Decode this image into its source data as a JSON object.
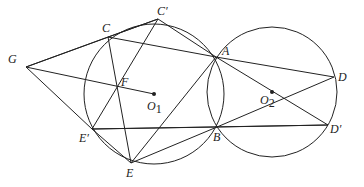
{
  "diagram": {
    "stroke_color": "#222222",
    "circles": [
      {
        "name": "O1",
        "cx": 154,
        "cy": 94,
        "r": 70
      },
      {
        "name": "O2",
        "cx": 272,
        "cy": 92,
        "r": 65
      }
    ],
    "points": {
      "G": {
        "x": 26,
        "y": 67,
        "label": "G",
        "lx": 8,
        "ly": 63
      },
      "C": {
        "x": 108,
        "y": 37,
        "label": "C",
        "lx": 102,
        "ly": 32
      },
      "Cp": {
        "x": 158,
        "y": 19,
        "label": "C′",
        "lx": 157,
        "ly": 15
      },
      "F": {
        "x": 117,
        "y": 87,
        "label": "F",
        "lx": 121,
        "ly": 86
      },
      "O1": {
        "x": 154,
        "y": 94,
        "label": "O",
        "sub": "1",
        "lx": 147,
        "ly": 110
      },
      "A": {
        "x": 216,
        "y": 57,
        "label": "A",
        "lx": 222,
        "ly": 55
      },
      "D": {
        "x": 334,
        "y": 77,
        "label": "D",
        "lx": 338,
        "ly": 81
      },
      "O2": {
        "x": 272,
        "y": 92,
        "label": "O",
        "sub": "2",
        "lx": 260,
        "ly": 104
      },
      "Dp": {
        "x": 328,
        "y": 125,
        "label": "D′",
        "lx": 330,
        "ly": 133
      },
      "B": {
        "x": 217,
        "y": 127,
        "label": "B",
        "lx": 213,
        "ly": 141
      },
      "Ep": {
        "x": 92,
        "y": 129,
        "label": "E′",
        "lx": 79,
        "ly": 142
      },
      "E": {
        "x": 131,
        "y": 163,
        "label": "E",
        "lx": 126,
        "ly": 177
      }
    },
    "segments": [
      [
        "G",
        "C"
      ],
      [
        "G",
        "Cp"
      ],
      [
        "G",
        "O1"
      ],
      [
        "G",
        "Ep"
      ],
      [
        "C",
        "Cp"
      ],
      [
        "C",
        "A"
      ],
      [
        "C",
        "E"
      ],
      [
        "Cp",
        "A"
      ],
      [
        "Cp",
        "Ep"
      ],
      [
        "A",
        "D"
      ],
      [
        "A",
        "E"
      ],
      [
        "A",
        "Dp"
      ],
      [
        "B",
        "D"
      ],
      [
        "B",
        "Dp"
      ],
      [
        "B",
        "Ep"
      ],
      [
        "B",
        "E"
      ],
      [
        "Ep",
        "E"
      ],
      [
        "Ep",
        "Dp"
      ]
    ]
  }
}
